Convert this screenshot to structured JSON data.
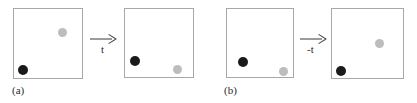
{
  "figure": {
    "caption_style": "two-panel time-reversal illustration",
    "colors": {
      "box_border": "#a8a8a8",
      "dark_particle": "#1a1a1a",
      "light_particle": "#bdbdbd",
      "background": "#ffffff",
      "text": "#2b2b2b"
    }
  },
  "panels": [
    {
      "id": "a",
      "label": "(a)",
      "arrow": {
        "name": "forward-time-arrow",
        "label": "t",
        "direction": "right"
      },
      "boxes": [
        {
          "name": "panel-a-box-initial",
          "x": 13,
          "y": 8,
          "w": 70,
          "h": 71,
          "particles": [
            {
              "name": "light-particle",
              "color": "light",
              "cx": 61,
              "cy": 31,
              "r": 4.5
            },
            {
              "name": "dark-particle",
              "color": "dark",
              "cx": 22,
              "cy": 69,
              "r": 5.0
            }
          ]
        },
        {
          "name": "panel-a-box-final",
          "x": 124,
          "y": 8,
          "w": 70,
          "h": 70,
          "particles": [
            {
              "name": "dark-particle",
              "color": "dark",
              "cx": 134,
              "cy": 60,
              "r": 5.0
            },
            {
              "name": "light-particle",
              "color": "light",
              "cx": 176,
              "cy": 68,
              "r": 4.5
            }
          ]
        }
      ]
    },
    {
      "id": "b",
      "label": "(b)",
      "arrow": {
        "name": "reverse-time-arrow",
        "label": "-t",
        "direction": "right"
      },
      "boxes": [
        {
          "name": "panel-b-box-initial",
          "x": 226,
          "y": 8,
          "w": 68,
          "h": 70,
          "particles": [
            {
              "name": "dark-particle",
              "color": "dark",
              "cx": 242,
              "cy": 61,
              "r": 5.0
            },
            {
              "name": "light-particle",
              "color": "light",
              "cx": 282,
              "cy": 70,
              "r": 4.5
            }
          ]
        },
        {
          "name": "panel-b-box-final",
          "x": 331,
          "y": 8,
          "w": 73,
          "h": 71,
          "particles": [
            {
              "name": "light-particle",
              "color": "light",
              "cx": 378,
              "cy": 42,
              "r": 4.5
            },
            {
              "name": "dark-particle",
              "color": "dark",
              "cx": 340,
              "cy": 70,
              "r": 5.0
            }
          ]
        }
      ]
    }
  ],
  "arrow_positions": {
    "a": {
      "x": 90,
      "y": 37,
      "w": 27,
      "label_x": 101,
      "label_y": 48
    },
    "b": {
      "x": 300,
      "y": 37,
      "w": 27,
      "label_x": 309,
      "label_y": 48
    }
  },
  "label_positions": {
    "a": {
      "x": 12,
      "y": 85
    },
    "b": {
      "x": 224,
      "y": 85
    }
  }
}
